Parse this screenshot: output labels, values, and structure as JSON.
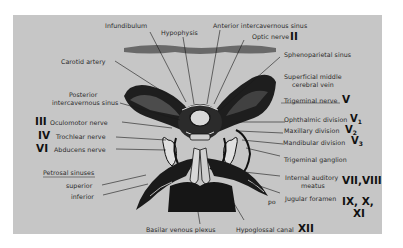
{
  "diagram": {
    "background_color": "#c6c6c6",
    "labels": {
      "infundibulum": "Infundibulum",
      "hypophysis": "Hypophysis",
      "anterior_intercavernous_sinus": "Anterior intercavernous sinus",
      "optic_nerve": "Optic nerve",
      "optic_nerve_roman": "II",
      "sphenoparietal_sinus": "Sphenoparietal sinus",
      "superficial_middle_cerebral_vein_1": "Superficial middle",
      "superficial_middle_cerebral_vein_2": "cerebral vein",
      "carotid_artery": "Carotid artery",
      "posterior_intercavernous_sinus_1": "Posterior",
      "posterior_intercavernous_sinus_2": "intercavernous sinus",
      "trigeminal_nerve": "Trigeminal nerve",
      "trigeminal_nerve_roman": "V",
      "oculomotor_roman": "III",
      "oculomotor_nerve": "Oculomotor nerve",
      "trochlear_roman": "IV",
      "trochlear_nerve": "Trochlear nerve",
      "abducens_roman": "VI",
      "abducens_nerve": "Abducens nerve",
      "ophthalmic_division": "Ophthalmic division",
      "ophthalmic_roman": "V",
      "ophthalmic_sub": "1",
      "maxillary_division": "Maxillary division",
      "maxillary_roman": "V",
      "maxillary_sub": "2",
      "mandibular_division": "Mandibular division",
      "mandibular_roman": "V",
      "mandibular_sub": "3",
      "trigeminal_ganglion": "Trigeminal ganglion",
      "petrosal_sinuses": "Petrosal sinuses",
      "superior": "superior",
      "inferior": "inferior",
      "internal_auditory_meatus_1": "Internal auditory",
      "internal_auditory_meatus_2": "meatus",
      "internal_auditory_roman": "VII,VIII",
      "jugular_foramen": "Jugular foramen",
      "jugular_roman_1": "IX, X,",
      "jugular_roman_2": "XI",
      "basilar_venous_plexus": "Basilar venous plexus",
      "hypoglossal_canal": "Hypoglossal canal",
      "hypoglossal_roman": "XII",
      "artist_mark": "ꝑ"
    }
  }
}
